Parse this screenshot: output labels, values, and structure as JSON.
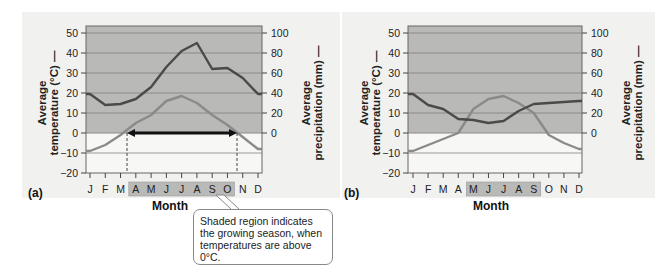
{
  "chart_data": [
    {
      "id": "a",
      "type": "line",
      "panel_label": "(a)",
      "title": "",
      "xlabel": "Month",
      "ylabel_left": "Average temperature (°C)",
      "ylabel_right": "Average precipitation (mm)",
      "categories": [
        "J",
        "F",
        "M",
        "A",
        "M",
        "J",
        "J",
        "A",
        "S",
        "O",
        "N",
        "D"
      ],
      "y_left_ticks": [
        50,
        40,
        30,
        20,
        10,
        0,
        -10,
        -20
      ],
      "y_right_ticks": [
        100,
        80,
        60,
        40,
        20,
        0
      ],
      "ylim_left": [
        -20,
        50
      ],
      "ylim_right": [
        -40,
        100
      ],
      "grid": true,
      "shaded_region_above_c": 0,
      "growing_season_months": [
        "A",
        "M",
        "J",
        "J",
        "A",
        "S",
        "O"
      ],
      "growing_season_arrow": "bidirectional arrow along 0°C from late March to late October",
      "series": [
        {
          "name": "Average temperature (°C)",
          "color": "#8a8a8a",
          "values": [
            -9,
            -6,
            -1,
            5,
            9,
            16,
            18.5,
            15,
            9,
            4,
            -2,
            -8
          ]
        },
        {
          "name": "Average precipitation (mm)",
          "color": "#4a4a4a",
          "values": [
            39,
            28,
            29,
            34,
            46,
            66,
            82,
            90,
            64,
            65,
            55,
            39
          ]
        }
      ]
    },
    {
      "id": "b",
      "type": "line",
      "panel_label": "(b)",
      "title": "",
      "xlabel": "Month",
      "ylabel_left": "Average temperature (°C)",
      "ylabel_right": "Average precipitation (mm)",
      "categories": [
        "J",
        "F",
        "M",
        "A",
        "M",
        "J",
        "J",
        "A",
        "S",
        "O",
        "N",
        "D"
      ],
      "y_left_ticks": [
        50,
        40,
        30,
        20,
        10,
        0,
        -10,
        -20
      ],
      "y_right_ticks": [
        100,
        80,
        60,
        40,
        20,
        0
      ],
      "ylim_left": [
        -20,
        50
      ],
      "ylim_right": [
        -40,
        100
      ],
      "grid": true,
      "shaded_region_above_c": 0,
      "growing_season_months": [
        "M",
        "J",
        "J",
        "A",
        "S"
      ],
      "series": [
        {
          "name": "Average temperature (°C)",
          "color": "#8a8a8a",
          "values": [
            -9,
            -6,
            -3,
            0,
            12,
            17,
            18.5,
            15,
            10,
            -1,
            -5,
            -8
          ]
        },
        {
          "name": "Average precipitation (mm)",
          "color": "#4a4a4a",
          "values": [
            39,
            28,
            24,
            14,
            13,
            10,
            12,
            22,
            29,
            30,
            31,
            32
          ]
        }
      ]
    }
  ],
  "callout": {
    "text": "Shaded region indicates the growing season, when temperatures are above 0°C."
  }
}
